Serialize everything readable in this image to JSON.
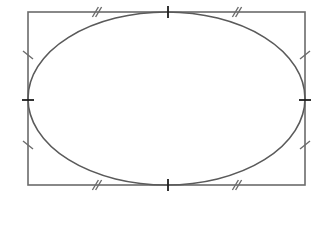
{
  "diagram": {
    "colors": {
      "background": "#ffffff",
      "rectangle_stroke": "#6b6b6b",
      "ellipse_stroke": "#5a5a5a",
      "tangent_tick_stroke": "#1e1e1e",
      "congruence_tick_stroke": "#6b6b6b"
    },
    "rectangle": {
      "x": 28,
      "y": 12,
      "width": 277,
      "height": 173,
      "stroke_width": 1.6
    },
    "ellipse": {
      "cx": 166.5,
      "cy": 98.5,
      "rx": 138.5,
      "ry": 86.5,
      "stroke_width": 1.6
    },
    "tangent_points": [
      {
        "name": "top",
        "x": 168,
        "y": 12,
        "orientation": "vertical"
      },
      {
        "name": "bottom",
        "x": 168,
        "y": 185,
        "orientation": "vertical"
      },
      {
        "name": "left",
        "x": 28,
        "y": 100,
        "orientation": "horizontal"
      },
      {
        "name": "right",
        "x": 305,
        "y": 100,
        "orientation": "horizontal"
      }
    ],
    "congruence_marks": [
      {
        "edge": "top",
        "segment": "left-half",
        "x": 97,
        "y": 12,
        "count": 2
      },
      {
        "edge": "top",
        "segment": "right-half",
        "x": 237,
        "y": 12,
        "count": 2
      },
      {
        "edge": "bottom",
        "segment": "left-half",
        "x": 97,
        "y": 185,
        "count": 2
      },
      {
        "edge": "bottom",
        "segment": "right-half",
        "x": 237,
        "y": 185,
        "count": 2
      },
      {
        "edge": "left",
        "segment": "upper-half",
        "x": 28,
        "y": 55,
        "count": 1
      },
      {
        "edge": "left",
        "segment": "lower-half",
        "x": 28,
        "y": 145,
        "count": 1
      },
      {
        "edge": "right",
        "segment": "upper-half",
        "x": 305,
        "y": 55,
        "count": 1
      },
      {
        "edge": "right",
        "segment": "lower-half",
        "x": 305,
        "y": 145,
        "count": 1
      }
    ]
  }
}
